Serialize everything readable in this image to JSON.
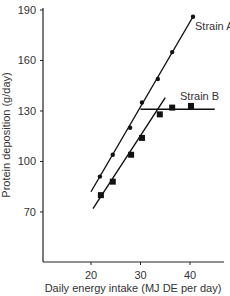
{
  "chart_data": {
    "type": "scatter",
    "title": "",
    "xlabel": "Daily energy intake (MJ DE per day)",
    "ylabel": "Protein deposition (g/day)",
    "xlim": [
      10,
      47
    ],
    "ylim": [
      40,
      190
    ],
    "x_ticks": [
      20,
      30,
      40
    ],
    "y_ticks": [
      70,
      100,
      130,
      160,
      190
    ],
    "grid": false,
    "legend": "inline labels",
    "series": [
      {
        "name": "Strain A",
        "marker": "circle",
        "points": [
          [
            21.8,
            91
          ],
          [
            24.4,
            104
          ],
          [
            27.9,
            120
          ],
          [
            30.3,
            135
          ],
          [
            33.5,
            149
          ],
          [
            36.4,
            165
          ],
          [
            40.6,
            186
          ]
        ],
        "fit_lines": [
          {
            "from": [
              20,
              82
            ],
            "to": [
              40.6,
              186
            ]
          }
        ]
      },
      {
        "name": "Strain B",
        "marker": "square",
        "points": [
          [
            22.0,
            80
          ],
          [
            24.4,
            88
          ],
          [
            28.1,
            104
          ],
          [
            30.3,
            114
          ],
          [
            33.9,
            128
          ],
          [
            36.4,
            132
          ],
          [
            40.2,
            133
          ]
        ],
        "fit_lines": [
          {
            "from": [
              20.4,
              72
            ],
            "to": [
              35.0,
              138
            ]
          },
          {
            "from": [
              30.0,
              131
            ],
            "to": [
              45.0,
              131
            ]
          }
        ]
      }
    ]
  }
}
